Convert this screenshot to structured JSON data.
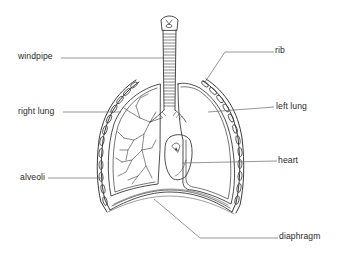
{
  "diagram": {
    "labels": {
      "windpipe": "windpipe",
      "right_lung": "right lung",
      "alveoli": "alveoli",
      "rib": "rib",
      "left_lung": "left lung",
      "heart": "heart",
      "diaphragm": "diaphragm"
    },
    "colors": {
      "background": "#ffffff",
      "ink": "#3a3a3a",
      "leader_line": "#6a6a6a",
      "label_text": "#2a2a2a"
    }
  }
}
